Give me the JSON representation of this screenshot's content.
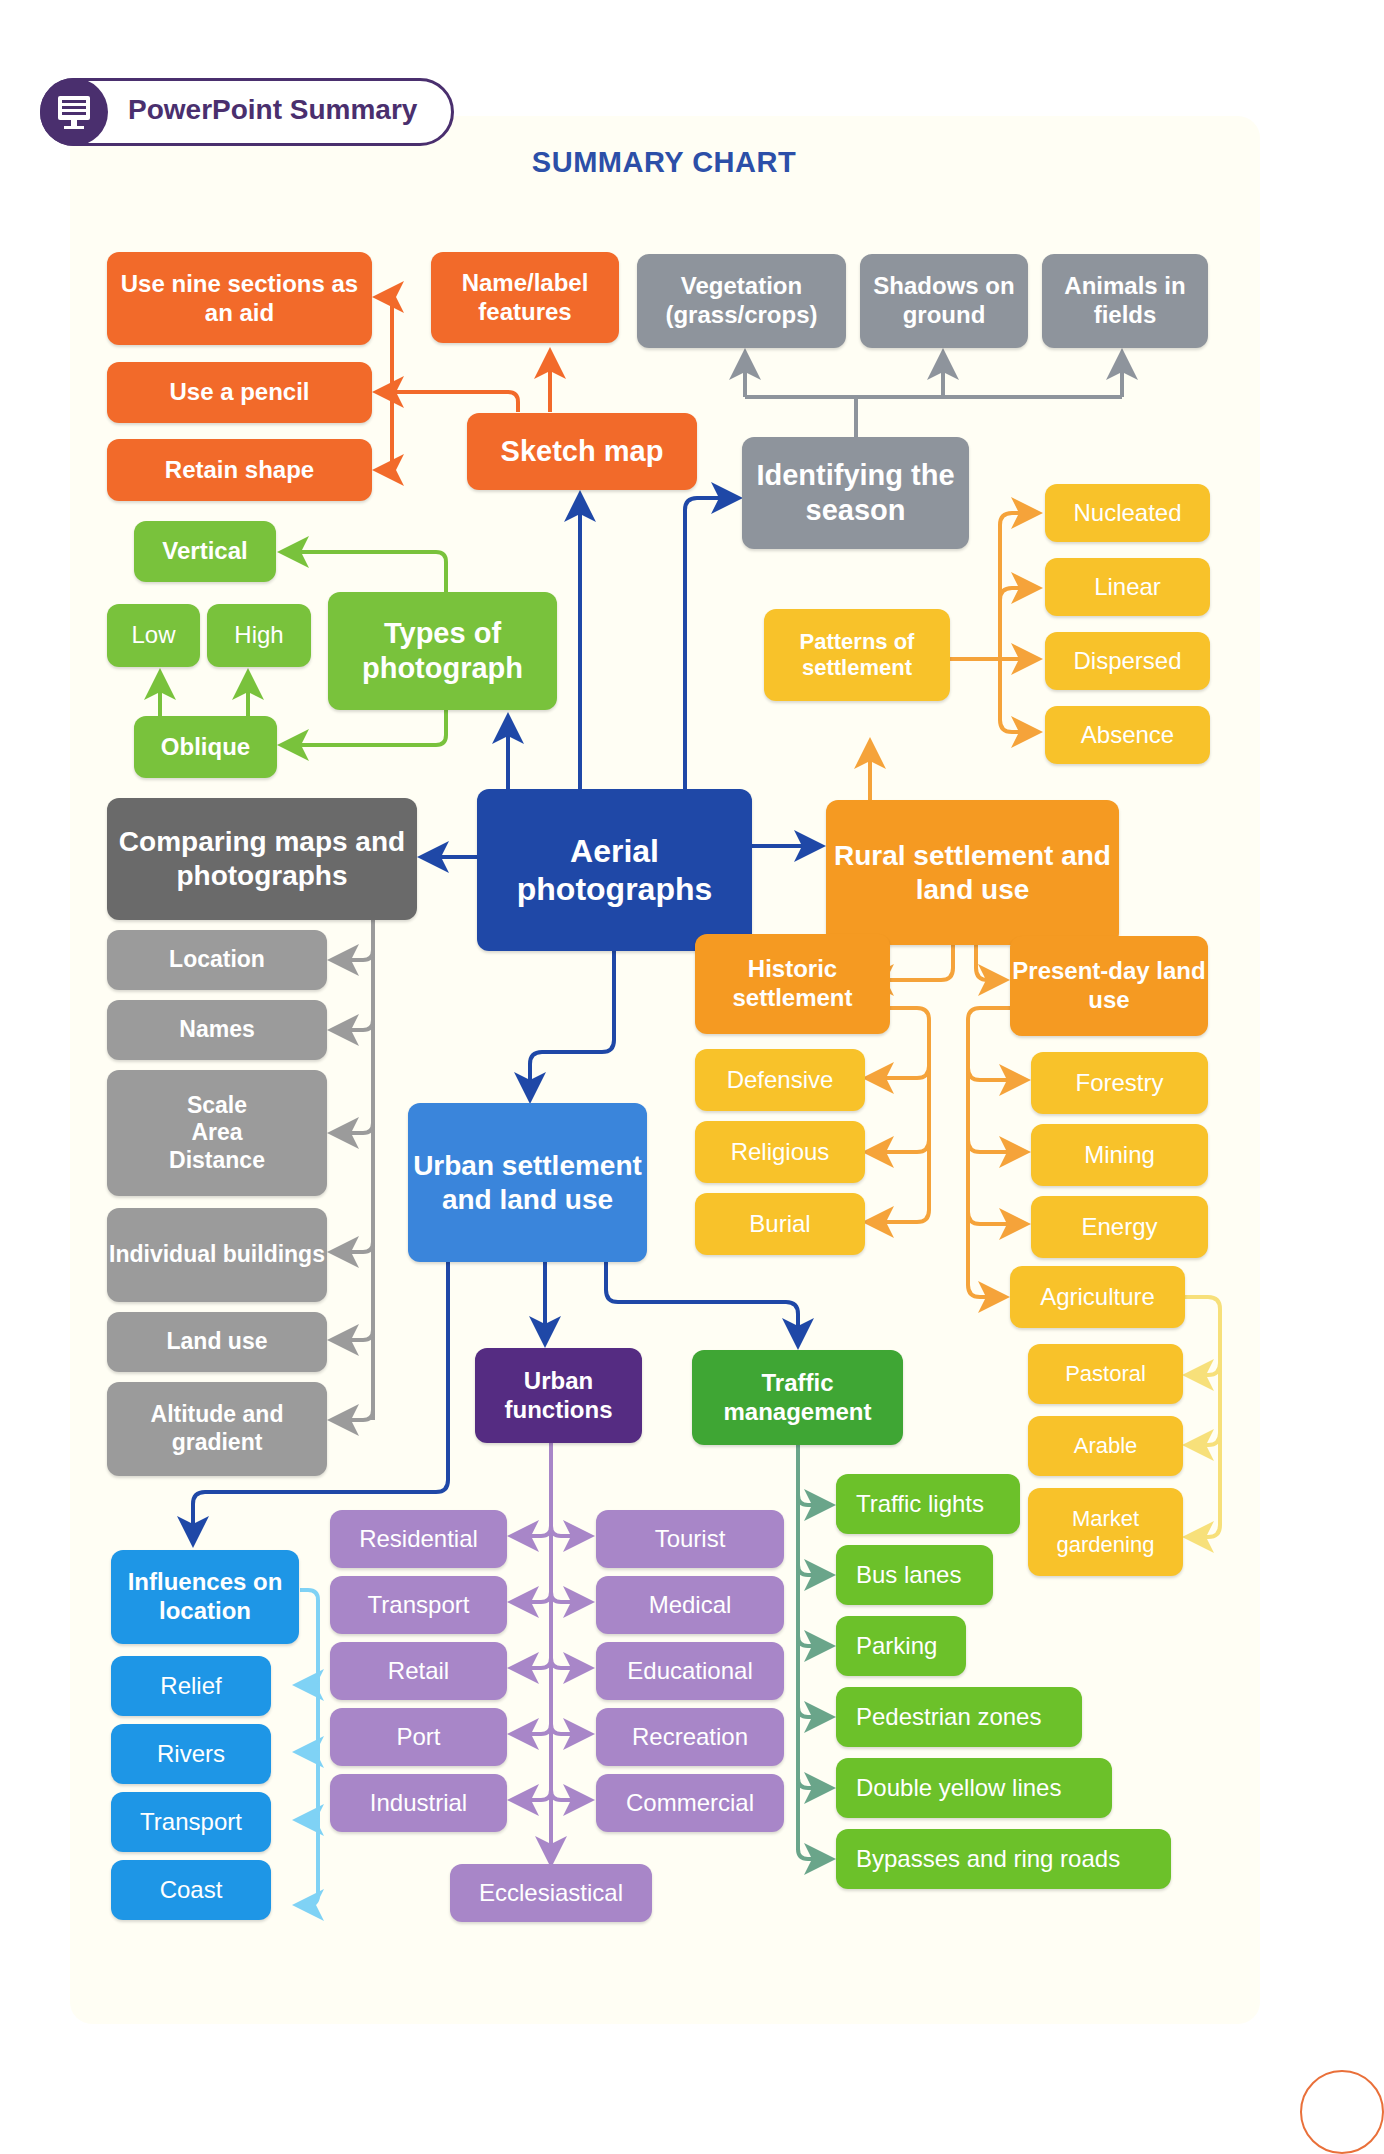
{
  "header": {
    "badge_label": "PowerPoint Summary",
    "badge_icon": "monitor-icon"
  },
  "title": "SUMMARY CHART",
  "center": "Aerial photographs",
  "sketch_map": {
    "label": "Sketch map",
    "children": [
      "Use nine sections as an aid",
      "Use a pencil",
      "Retain shape",
      "Name/label features"
    ]
  },
  "season": {
    "label": "Identifying the season",
    "children": [
      "Vegetation (grass/crops)",
      "Shadows on ground",
      "Animals in fields"
    ]
  },
  "types": {
    "label": "Types of photograph",
    "vertical": "Vertical",
    "oblique": "Oblique",
    "oblique_children": [
      "Low",
      "High"
    ]
  },
  "comparing": {
    "label": "Comparing maps and photographs",
    "children": [
      "Location",
      "Names",
      "Scale\nArea\nDistance",
      "Individual buildings",
      "Land use",
      "Altitude and gradient"
    ]
  },
  "rural": {
    "label": "Rural settlement and land use",
    "patterns": {
      "label": "Patterns of settlement",
      "children": [
        "Nucleated",
        "Linear",
        "Dispersed",
        "Absence"
      ]
    },
    "historic": {
      "label": "Historic settlement",
      "children": [
        "Defensive",
        "Religious",
        "Burial"
      ]
    },
    "present": {
      "label": "Present-day land use",
      "children": [
        "Forestry",
        "Mining",
        "Energy",
        "Agriculture"
      ]
    },
    "agriculture_children": [
      "Pastoral",
      "Arable",
      "Market gardening"
    ]
  },
  "urban": {
    "label": "Urban settlement and land use",
    "influences": {
      "label": "Influences on location",
      "children": [
        "Relief",
        "Rivers",
        "Transport",
        "Coast"
      ]
    },
    "functions": {
      "label": "Urban functions",
      "left": [
        "Residential",
        "Transport",
        "Retail",
        "Port",
        "Industrial"
      ],
      "right": [
        "Tourist",
        "Medical",
        "Educational",
        "Recreation",
        "Commercial"
      ],
      "bottom": "Ecclesiastical"
    },
    "traffic": {
      "label": "Traffic management",
      "children": [
        "Traffic lights",
        "Bus lanes",
        "Parking",
        "Pedestrian zones",
        "Double yellow lines",
        "Bypasses and ring roads"
      ]
    }
  },
  "colors": {
    "sketch": "#f26a2a",
    "season": "#8e949c",
    "types": "#79c23c",
    "center": "#1f48a7",
    "comparing": "#6a6a6a",
    "rural": "#f59a22",
    "rural_leaf": "#f8c22a",
    "urban": "#3a85db",
    "functions": "#552c82",
    "functions_leaf": "#a886c8",
    "traffic": "#3fa634",
    "influences": "#1e96e6",
    "title": "#2c4fa8",
    "badge": "#4a2f6e"
  }
}
